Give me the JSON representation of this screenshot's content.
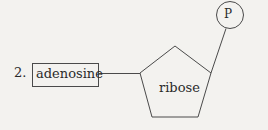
{
  "diagram": {
    "item_number": "2.",
    "adenosine": {
      "label": "adenosine"
    },
    "ribose": {
      "label": "ribose"
    },
    "phosphate": {
      "label": "P"
    },
    "colors": {
      "background": "#f3f2ef",
      "stroke": "#4a4a4a",
      "text": "#2a2a2a"
    }
  }
}
